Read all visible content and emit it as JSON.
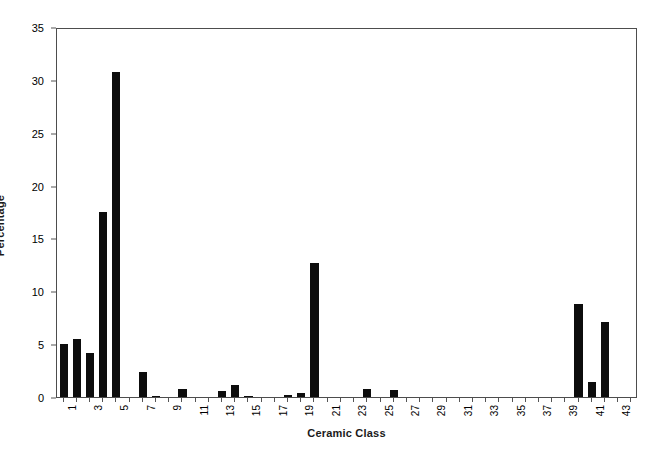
{
  "chart_data": {
    "type": "bar",
    "title": "",
    "xlabel": "Ceramic Class",
    "ylabel": "Percentage",
    "ylim": [
      0,
      35
    ],
    "yticks": [
      0,
      5,
      10,
      15,
      20,
      25,
      30,
      35
    ],
    "ytick_labels": [
      "0",
      "5",
      "10",
      "15",
      "20",
      "25",
      "30",
      "35"
    ],
    "xlim": [
      0.5,
      44.5
    ],
    "xticks": [
      1,
      3,
      5,
      7,
      9,
      11,
      13,
      15,
      17,
      19,
      21,
      23,
      25,
      27,
      29,
      31,
      33,
      35,
      37,
      39,
      41,
      43
    ],
    "xtick_labels": [
      "1",
      "3",
      "5",
      "7",
      "9",
      "11",
      "13",
      "15",
      "17",
      "19",
      "21",
      "23",
      "25",
      "27",
      "29",
      "31",
      "33",
      "35",
      "37",
      "39",
      "41",
      "43"
    ],
    "grid": false,
    "legend": null,
    "bar_color": "#0d0d0d",
    "categories": [
      1,
      2,
      3,
      4,
      5,
      6,
      7,
      8,
      9,
      10,
      11,
      12,
      13,
      14,
      15,
      16,
      17,
      18,
      19,
      20,
      21,
      22,
      23,
      24,
      25,
      26,
      27,
      28,
      29,
      30,
      31,
      32,
      33,
      34,
      35,
      36,
      37,
      38,
      39,
      40,
      41,
      42,
      43,
      44
    ],
    "values": [
      5.0,
      5.5,
      4.2,
      17.5,
      30.7,
      0.0,
      2.4,
      0.1,
      0.0,
      0.8,
      0.0,
      0.0,
      0.6,
      1.1,
      0.1,
      0.0,
      0.0,
      0.2,
      0.4,
      12.7,
      0.0,
      0.0,
      0.0,
      0.8,
      0.0,
      0.7,
      0.0,
      0.0,
      0.0,
      0.0,
      0.0,
      0.0,
      0.0,
      0.0,
      0.0,
      0.0,
      0.0,
      0.0,
      0.0,
      8.8,
      1.4,
      7.1,
      0.0,
      0.0
    ]
  }
}
